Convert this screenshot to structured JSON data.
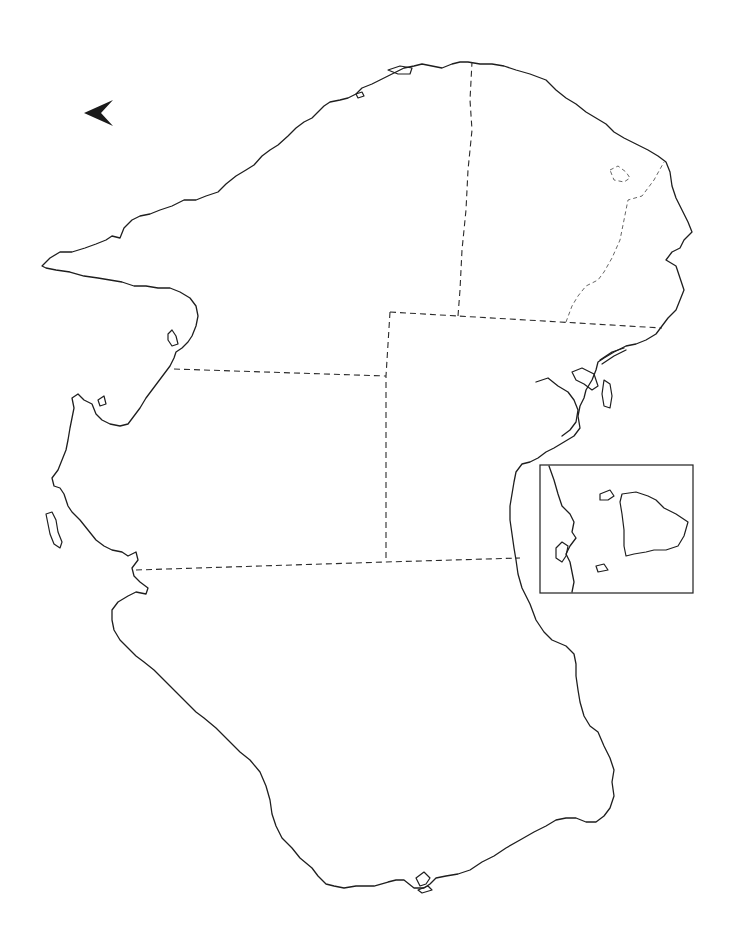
{
  "map": {
    "type": "blank outline map",
    "title": "",
    "regions_count": 6,
    "has_inset": true,
    "has_north_arrow": true,
    "colors": {
      "background": "#ffffff",
      "coastline": "#1e1e1e",
      "border": "#2a2a2a"
    }
  },
  "north_arrow": {
    "icon": "north-arrow-icon",
    "direction": "left"
  },
  "inset": {
    "label": ""
  }
}
